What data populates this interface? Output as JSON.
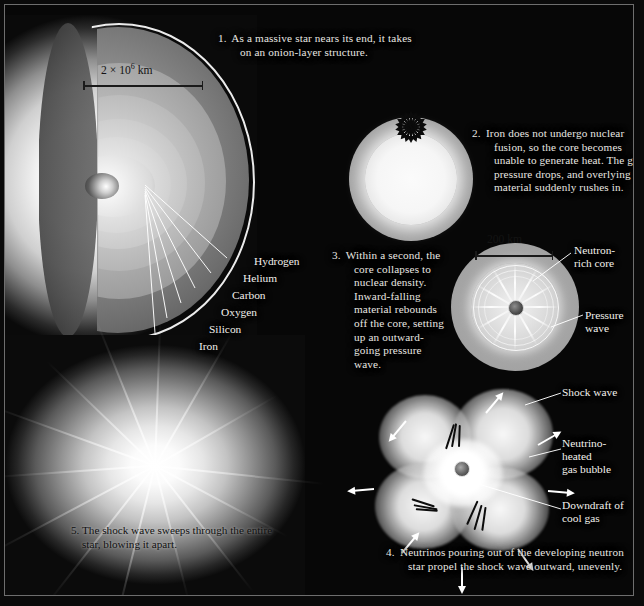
{
  "figure": {
    "background_color": "#070707",
    "text_color": "#f2f0ec",
    "dark_text_color": "#101010"
  },
  "captions": [
    {
      "number": "1.",
      "text": "As a massive star nears its end, it takes on an onion-layer structure."
    },
    {
      "number": "2.",
      "text": "Iron does not undergo nuclear fusion, so the core becomes unable to generate heat. The gas pressure drops, and overlying material suddenly rushes in."
    },
    {
      "number": "3.",
      "text": "Within a second, the core collapses to nuclear density. Inward-falling material rebounds off the core, setting up an outward-going pressure wave."
    },
    {
      "number": "4.",
      "text": "Neutrinos pouring out of the developing neutron star propel the shock wave outward, unevenly."
    },
    {
      "number": "5.",
      "text": "The shock wave sweeps through the entire star, blowing it apart."
    }
  ],
  "layer_labels": [
    {
      "name": "Hydrogen"
    },
    {
      "name": "Helium"
    },
    {
      "name": "Carbon"
    },
    {
      "name": "Oxygen"
    },
    {
      "name": "Silicon"
    },
    {
      "name": "Iron"
    }
  ],
  "scale_bars": [
    {
      "id": "star-scale",
      "label_prefix": "2 × 10",
      "label_exponent": "6",
      "label_suffix": " km"
    },
    {
      "id": "core-scale",
      "label": "200 km"
    }
  ],
  "feature_labels": [
    {
      "name": "Neutron-rich core",
      "line1": "Neutron-",
      "line2": "rich core"
    },
    {
      "name": "Pressure wave",
      "line1": "Pressure",
      "line2": "wave"
    },
    {
      "name": "Shock wave",
      "line1": "Shock wave",
      "line2": ""
    },
    {
      "name": "Neutrino-heated gas bubble",
      "line1": "Neutrino-",
      "line2": "heated",
      "line3": "gas bubble"
    },
    {
      "name": "Downdraft of cool gas",
      "line1": "Downdraft of",
      "line2": "cool gas"
    }
  ]
}
